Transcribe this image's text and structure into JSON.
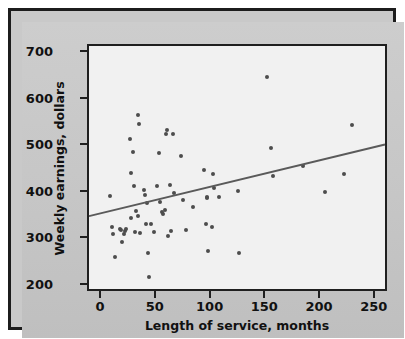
{
  "chart_data": {
    "type": "scatter",
    "title": "",
    "xlabel": "Length of service, months",
    "ylabel": "Weekly earnings, dollars",
    "xlim": [
      -12,
      262
    ],
    "ylim": [
      185,
      715
    ],
    "xticks": [
      0,
      50,
      100,
      150,
      200,
      250
    ],
    "yticks": [
      200,
      300,
      400,
      500,
      600,
      700
    ],
    "xtick_labels": [
      "0",
      "50",
      "100",
      "150",
      "200",
      "250"
    ],
    "ytick_labels": [
      "200",
      "300",
      "400",
      "500",
      "600",
      "700"
    ],
    "grid": false,
    "legend": null,
    "marker_color": "#4d4d4d",
    "line_color": "#5a5a5a",
    "plot_background": "#f1f1f1",
    "figure_background": "#c9c9c9",
    "frame_color": "#1c1c1c",
    "series": [
      {
        "name": "Employees",
        "marker": "circle",
        "points": [
          [
            7,
            393
          ],
          [
            9,
            326
          ],
          [
            10,
            312
          ],
          [
            12,
            262
          ],
          [
            16,
            322
          ],
          [
            17,
            321
          ],
          [
            18,
            295
          ],
          [
            20,
            312
          ],
          [
            21,
            318
          ],
          [
            22,
            322
          ],
          [
            25,
            515
          ],
          [
            26,
            443
          ],
          [
            26,
            347
          ],
          [
            28,
            488
          ],
          [
            29,
            415
          ],
          [
            30,
            316
          ],
          [
            31,
            360
          ],
          [
            33,
            568
          ],
          [
            33,
            350
          ],
          [
            34,
            547
          ],
          [
            35,
            313
          ],
          [
            38,
            407
          ],
          [
            39,
            395
          ],
          [
            40,
            333
          ],
          [
            41,
            378
          ],
          [
            42,
            271
          ],
          [
            43,
            220
          ],
          [
            45,
            334
          ],
          [
            47,
            316
          ],
          [
            50,
            414
          ],
          [
            52,
            485
          ],
          [
            53,
            380
          ],
          [
            55,
            358
          ],
          [
            56,
            354
          ],
          [
            57,
            363
          ],
          [
            58,
            526
          ],
          [
            59,
            535
          ],
          [
            60,
            307
          ],
          [
            62,
            416
          ],
          [
            63,
            318
          ],
          [
            65,
            527
          ],
          [
            66,
            400
          ],
          [
            72,
            478
          ],
          [
            74,
            384
          ],
          [
            77,
            320
          ],
          [
            83,
            369
          ],
          [
            93,
            449
          ],
          [
            95,
            333
          ],
          [
            96,
            390
          ],
          [
            96,
            388
          ],
          [
            97,
            276
          ],
          [
            100,
            327
          ],
          [
            101,
            441
          ],
          [
            102,
            410
          ],
          [
            107,
            390
          ],
          [
            124,
            403
          ],
          [
            125,
            271
          ],
          [
            151,
            648
          ],
          [
            154,
            497
          ],
          [
            156,
            436
          ],
          [
            183,
            458
          ],
          [
            204,
            401
          ],
          [
            221,
            440
          ],
          [
            228,
            545
          ]
        ]
      }
    ],
    "trend_line": {
      "name": "Regression line",
      "x_start": -12,
      "y_start": 344,
      "x_end": 262,
      "y_end": 500
    }
  },
  "axes": {
    "y_title": "Weekly earnings, dollars",
    "x_title": "Length of service, months"
  }
}
